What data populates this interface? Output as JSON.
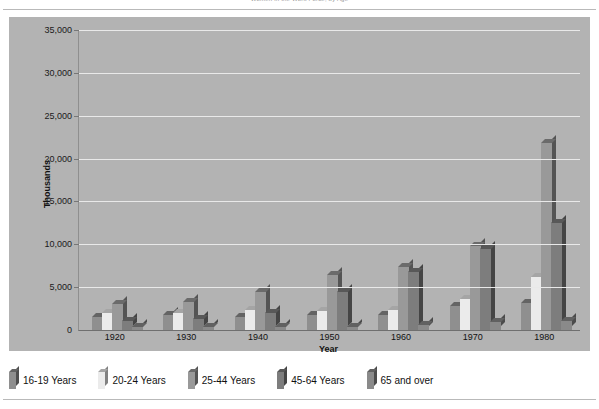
{
  "document": {
    "top_caption": "Women in the Work Force, by Age"
  },
  "chart_data": {
    "type": "bar",
    "title": "",
    "xlabel": "Year",
    "ylabel": "Thousands",
    "ylim": [
      0,
      35000
    ],
    "ytick_labels": [
      "35,000",
      "30,000",
      "25,000",
      "20,000",
      "15,000",
      "10,000",
      "5,000",
      "0"
    ],
    "ytick_values": [
      35000,
      30000,
      25000,
      20000,
      15000,
      10000,
      5000,
      0
    ],
    "grid": true,
    "legend_position": "bottom",
    "categories": [
      "1920",
      "1930",
      "1940",
      "1950",
      "1960",
      "1970",
      "1980"
    ],
    "series": [
      {
        "name": "16-19 Years",
        "color": "#8f8f8f",
        "values": [
          1500,
          1700,
          1500,
          1700,
          1800,
          2800,
          3100
        ]
      },
      {
        "name": "20-24 Years",
        "color": "#ebebeb",
        "values": [
          2000,
          2000,
          2300,
          2200,
          2300,
          3600,
          6200
        ]
      },
      {
        "name": "25-44 Years",
        "color": "#999999",
        "values": [
          3000,
          3300,
          4400,
          6400,
          7300,
          9800,
          21800
        ]
      },
      {
        "name": "45-64 Years",
        "color": "#7d7d7d",
        "values": [
          1000,
          1300,
          2000,
          4400,
          6800,
          9400,
          12500
        ]
      },
      {
        "name": "65 and over",
        "color": "#8a8a8a",
        "values": [
          300,
          300,
          300,
          400,
          600,
          900,
          1100
        ]
      }
    ]
  },
  "legend": {
    "items": [
      {
        "label": "16-19 Years"
      },
      {
        "label": "20-24 Years"
      },
      {
        "label": "25-44 Years"
      },
      {
        "label": "45-64 Years"
      },
      {
        "label": "65 and over"
      }
    ]
  },
  "colors": {
    "plot_background": "#b3b3b3",
    "gridline": "#e9e9e9",
    "page_background": "#ffffff",
    "rule": "#b9b9b9"
  }
}
